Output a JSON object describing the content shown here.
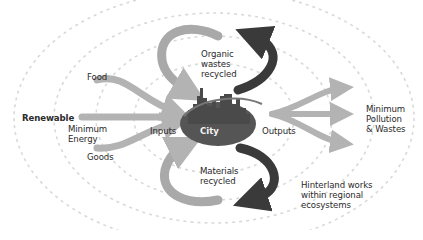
{
  "diagram": {
    "center": {
      "label": "City"
    },
    "labels": {
      "renewable": "Renewable",
      "food": "Food",
      "minimum_energy_1": "Minimum",
      "minimum_energy_2": "Energy",
      "goods": "Goods",
      "inputs": "Inputs",
      "outputs": "Outputs",
      "pollution_1": "Minimum",
      "pollution_2": "Pollution",
      "pollution_3": "& Wastes",
      "organic_1": "Organic",
      "organic_2": "wastes",
      "organic_3": "recycled",
      "materials_1": "Materials",
      "materials_2": "recycled",
      "hinterland_1": "Hinterland works",
      "hinterland_2": "within regional",
      "hinterland_3": "ecosystems"
    },
    "colors": {
      "light_arrow": "#b3b3b3",
      "dark_arrow": "#3a3a3a",
      "city_fill": "#555555",
      "dashed_ring": "#d9d9d9",
      "text": "#2b2b2b"
    }
  }
}
